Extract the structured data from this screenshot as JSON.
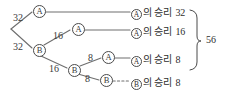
{
  "diagram": {
    "type": "binary-game-tree",
    "title": "",
    "root": {
      "label": "",
      "x": 11,
      "y": 29
    },
    "edge_labels": [
      {
        "id": "root-to-a1",
        "value": "32",
        "x": 13,
        "y": 12
      },
      {
        "id": "root-to-b1",
        "value": "32",
        "x": 13,
        "y": 41
      },
      {
        "id": "b1-to-a2",
        "value": "16",
        "x": 53,
        "y": 30
      },
      {
        "id": "b1-to-b2",
        "value": "16",
        "x": 49,
        "y": 63
      },
      {
        "id": "b2-to-a3",
        "value": "8",
        "x": 88,
        "y": 53
      },
      {
        "id": "b2-to-b3",
        "value": "8",
        "x": 85,
        "y": 74
      }
    ],
    "nodes": [
      {
        "id": "a1",
        "label": "A",
        "x": 33,
        "y": 5
      },
      {
        "id": "b1",
        "label": "B",
        "x": 33,
        "y": 44
      },
      {
        "id": "a2",
        "label": "A",
        "x": 72,
        "y": 23
      },
      {
        "id": "b2",
        "label": "B",
        "x": 68,
        "y": 64
      },
      {
        "id": "a3",
        "label": "A",
        "x": 102,
        "y": 52
      },
      {
        "id": "b3",
        "label": "B",
        "x": 100,
        "y": 74
      }
    ],
    "outcomes": [
      {
        "id": "row-1",
        "mark": "A",
        "text": "의 승리",
        "count": "32",
        "x": 131,
        "y": 3,
        "line_style": "solid"
      },
      {
        "id": "row-2",
        "mark": "A",
        "text": "의 승리",
        "count": "16",
        "x": 131,
        "y": 22,
        "line_style": "solid"
      },
      {
        "id": "row-3",
        "mark": "A",
        "text": "의 승리",
        "count": "8",
        "x": 131,
        "y": 50,
        "line_style": "solid"
      },
      {
        "id": "row-4",
        "mark": "B",
        "text": "의 승리",
        "count": "8",
        "x": 131,
        "y": 74,
        "line_style": "dotted"
      }
    ],
    "brace": {
      "total": "56",
      "x": 206,
      "y": 40
    },
    "colors": {
      "stroke": "#6e6e6e",
      "node_stroke": "#4a4a4a",
      "text": "#2e2e2e",
      "background": "#ffffff"
    }
  }
}
